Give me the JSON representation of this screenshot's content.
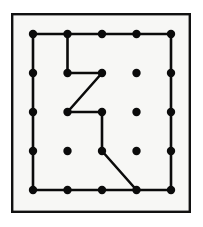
{
  "figure": {
    "background_color": "#f7f7f5",
    "page_color": "#ffffff",
    "ink_color": "#000000"
  },
  "frame": {
    "name": "outer-border",
    "x": 11,
    "y": 13,
    "width": 180,
    "height": 200,
    "stroke_width": 2.4,
    "fill": "#f7f7f5",
    "stroke": "#111111"
  },
  "grid": {
    "rows": 5,
    "cols": 5,
    "origin_x": 33,
    "origin_y": 34,
    "spacing_x": 34.5,
    "spacing_y": 39,
    "dot_radius": 4.2,
    "dot_color": "#0b0b0b"
  },
  "dots": [
    {
      "id": "r1c1",
      "row": 1,
      "col": 1,
      "x": 33,
      "y": 34,
      "on_path": true
    },
    {
      "id": "r1c2",
      "row": 1,
      "col": 2,
      "x": 67.5,
      "y": 34,
      "on_path": true
    },
    {
      "id": "r1c3",
      "row": 1,
      "col": 3,
      "x": 102,
      "y": 34,
      "on_path": true
    },
    {
      "id": "r1c4",
      "row": 1,
      "col": 4,
      "x": 136.5,
      "y": 34,
      "on_path": true
    },
    {
      "id": "r1c5",
      "row": 1,
      "col": 5,
      "x": 171,
      "y": 34,
      "on_path": true
    },
    {
      "id": "r2c1",
      "row": 2,
      "col": 1,
      "x": 33,
      "y": 73,
      "on_path": true
    },
    {
      "id": "r2c2",
      "row": 2,
      "col": 2,
      "x": 67.5,
      "y": 73,
      "on_path": true
    },
    {
      "id": "r2c3",
      "row": 2,
      "col": 3,
      "x": 102,
      "y": 73,
      "on_path": true
    },
    {
      "id": "r2c4",
      "row": 2,
      "col": 4,
      "x": 136.5,
      "y": 73,
      "on_path": false
    },
    {
      "id": "r2c5",
      "row": 2,
      "col": 5,
      "x": 171,
      "y": 73,
      "on_path": true
    },
    {
      "id": "r3c1",
      "row": 3,
      "col": 1,
      "x": 33,
      "y": 112,
      "on_path": true
    },
    {
      "id": "r3c2",
      "row": 3,
      "col": 2,
      "x": 67.5,
      "y": 112,
      "on_path": true
    },
    {
      "id": "r3c3",
      "row": 3,
      "col": 3,
      "x": 102,
      "y": 112,
      "on_path": true
    },
    {
      "id": "r3c4",
      "row": 3,
      "col": 4,
      "x": 136.5,
      "y": 112,
      "on_path": false
    },
    {
      "id": "r3c5",
      "row": 3,
      "col": 5,
      "x": 171,
      "y": 112,
      "on_path": true
    },
    {
      "id": "r4c1",
      "row": 4,
      "col": 1,
      "x": 33,
      "y": 151,
      "on_path": true
    },
    {
      "id": "r4c2",
      "row": 4,
      "col": 2,
      "x": 67.5,
      "y": 151,
      "on_path": false
    },
    {
      "id": "r4c3",
      "row": 4,
      "col": 3,
      "x": 102,
      "y": 151,
      "on_path": true
    },
    {
      "id": "r4c4",
      "row": 4,
      "col": 4,
      "x": 136.5,
      "y": 151,
      "on_path": false
    },
    {
      "id": "r4c5",
      "row": 4,
      "col": 5,
      "x": 171,
      "y": 151,
      "on_path": true
    },
    {
      "id": "r5c1",
      "row": 5,
      "col": 1,
      "x": 33,
      "y": 190,
      "on_path": true
    },
    {
      "id": "r5c2",
      "row": 5,
      "col": 2,
      "x": 67.5,
      "y": 190,
      "on_path": true
    },
    {
      "id": "r5c3",
      "row": 5,
      "col": 3,
      "x": 102,
      "y": 190,
      "on_path": true
    },
    {
      "id": "r5c4",
      "row": 5,
      "col": 4,
      "x": 136.5,
      "y": 190,
      "on_path": true
    },
    {
      "id": "r5c5",
      "row": 5,
      "col": 5,
      "x": 171,
      "y": 190,
      "on_path": true
    }
  ],
  "polygon": {
    "name": "rubber-band-path",
    "stroke_width": 2.6,
    "stroke": "#0b0b0b",
    "closed": true,
    "vertex_ids": [
      "r1c1",
      "r1c5",
      "r5c5",
      "r5c4",
      "r4c3",
      "r3c3",
      "r3c2",
      "r2c3",
      "r2c2",
      "r1c2",
      "r1c1"
    ],
    "points": "33,34 171,34 171,190 136.5,190 102,151 102,112 67.5,112 102,73 67.5,73 67.5,34 33,34",
    "left_edge_points": "33,34 33,190 102,190"
  },
  "segments": [
    {
      "from": "r1c1",
      "to": "r1c5",
      "kind": "horizontal"
    },
    {
      "from": "r1c5",
      "to": "r5c5",
      "kind": "vertical"
    },
    {
      "from": "r5c5",
      "to": "r5c1",
      "kind": "horizontal"
    },
    {
      "from": "r5c1",
      "to": "r1c1",
      "kind": "vertical"
    },
    {
      "from": "r5c4",
      "to": "r4c3",
      "kind": "diagonal"
    },
    {
      "from": "r4c3",
      "to": "r3c3",
      "kind": "vertical"
    },
    {
      "from": "r3c3",
      "to": "r3c2",
      "kind": "horizontal"
    },
    {
      "from": "r3c2",
      "to": "r2c3",
      "kind": "diagonal"
    },
    {
      "from": "r2c3",
      "to": "r2c2",
      "kind": "horizontal"
    },
    {
      "from": "r2c2",
      "to": "r1c2",
      "kind": "vertical"
    }
  ]
}
